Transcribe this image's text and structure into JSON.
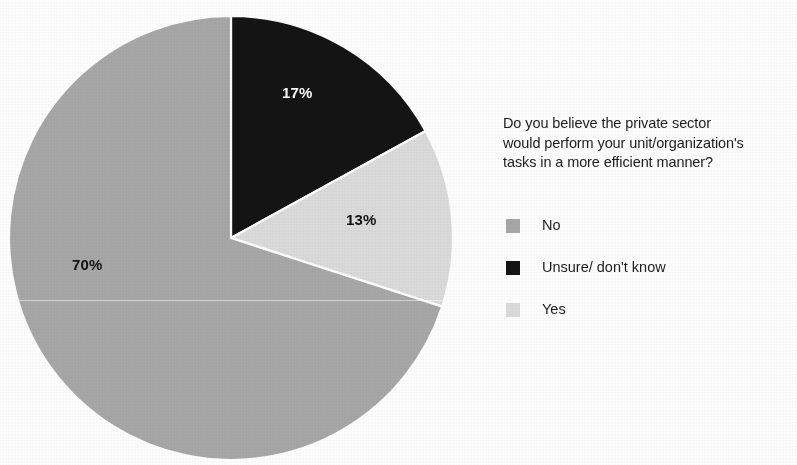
{
  "chart_data": {
    "type": "pie",
    "title": "Do you believe the private sector would perform your unit/organization's tasks in a more efficient manner?",
    "title_lines": [
      "Do you believe the private sector",
      "would perform your unit/organization's",
      "tasks in a more efficient manner?"
    ],
    "categories": [
      "No",
      "Unsure/ don't know",
      "Yes"
    ],
    "values": [
      70,
      17,
      13
    ],
    "value_labels": [
      "70%",
      "17%",
      "13%"
    ],
    "colors": [
      "#a8a8a8",
      "#141414",
      "#dcdcdc"
    ],
    "slice_order_clockwise_from_top": [
      "Unsure/ don't know",
      "Yes",
      "No"
    ],
    "legend_position": "right",
    "grid": false,
    "units": "percent"
  },
  "pie": {
    "center_x": 231,
    "center_y": 238,
    "radius": 222,
    "separator_color": "#ffffff",
    "slices": [
      {
        "name": "Unsure/ don't know",
        "percent": 17,
        "label": "17%",
        "color": "#141414",
        "label_color": "#ffffff",
        "start_deg": 0,
        "end_deg": 61.2
      },
      {
        "name": "Yes",
        "percent": 13,
        "label": "13%",
        "color": "#dcdcdc",
        "label_color": "#111111",
        "start_deg": 61.2,
        "end_deg": 108
      },
      {
        "name": "No",
        "percent": 70,
        "label": "70%",
        "color": "#a8a8a8",
        "label_color": "#111111",
        "start_deg": 108,
        "end_deg": 360
      }
    ]
  },
  "legend": {
    "items": [
      {
        "label": "No",
        "color": "#a8a8a8"
      },
      {
        "label": "Unsure/ don't know",
        "color": "#141414"
      },
      {
        "label": "Yes",
        "color": "#dcdcdc"
      }
    ]
  }
}
